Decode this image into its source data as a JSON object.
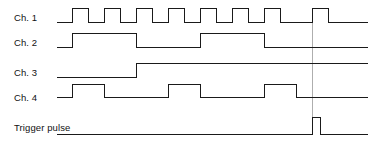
{
  "figure": {
    "type": "timing-diagram",
    "background_color": "#ffffff",
    "trace_color": "#1a1a1a",
    "marker_color": "#9a9a9a",
    "width": 374,
    "height": 145
  },
  "labels": [
    {
      "id": "ch1",
      "text": "Ch. 1",
      "x": 14,
      "y": 13
    },
    {
      "id": "ch2",
      "text": "Ch. 2",
      "x": 14,
      "y": 38
    },
    {
      "id": "ch3",
      "text": "Ch. 3",
      "x": 14,
      "y": 68
    },
    {
      "id": "ch4",
      "text": "Ch. 4",
      "x": 14,
      "y": 93
    },
    {
      "id": "trigger",
      "text": "Trigger pulse",
      "x": 14,
      "y": 123
    }
  ],
  "chart_data": {
    "type": "line",
    "title": "",
    "xlabel": "",
    "ylabel": "",
    "grid": false,
    "legend_position": "left-labels",
    "axis_units": "arbitrary time units",
    "time_axis": {
      "start_px": 57,
      "end_px": 368,
      "base_period_px": 32
    },
    "series": [
      {
        "name": "Ch. 1",
        "description": "Square wave clock, 8 pulses, period 32 px, 50% duty",
        "baseline_y": 22,
        "high_y": 8,
        "start_x": 57,
        "end_x": 368,
        "initial_level": "low",
        "edges_x": [
          72,
          88,
          104,
          120,
          136,
          152,
          168,
          184,
          200,
          216,
          232,
          248,
          264,
          280,
          312,
          328
        ]
      },
      {
        "name": "Ch. 2",
        "description": "Divide-by-4 square wave, 2 full pulses visible",
        "baseline_y": 47,
        "high_y": 33,
        "start_x": 57,
        "end_x": 368,
        "initial_level": "low",
        "edges_x": [
          72,
          136,
          200,
          264
        ]
      },
      {
        "name": "Ch. 3",
        "description": "Single rising edge, stays high",
        "baseline_y": 77,
        "high_y": 63,
        "start_x": 57,
        "end_x": 368,
        "initial_level": "low",
        "edges_x": [
          136
        ]
      },
      {
        "name": "Ch. 4",
        "description": "Divide-by-2 square wave, 3 pulses visible",
        "baseline_y": 97,
        "high_y": 84,
        "start_x": 57,
        "end_x": 368,
        "initial_level": "low",
        "edges_x": [
          72,
          104,
          168,
          200,
          264,
          296
        ]
      },
      {
        "name": "Trigger pulse",
        "description": "Single narrow pulse at the trigger instant",
        "baseline_y": 134,
        "high_y": 117,
        "start_x": 57,
        "end_x": 368,
        "initial_level": "low",
        "edges_x": [
          312,
          320
        ]
      }
    ],
    "annotations": [
      {
        "name": "trigger-time-marker",
        "type": "vertical-line",
        "x": 312,
        "y_top": 10,
        "y_bottom": 134,
        "style": "thin-gray"
      }
    ]
  }
}
